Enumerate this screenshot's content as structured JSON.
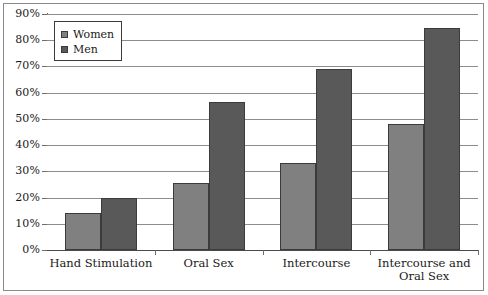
{
  "chart_data": {
    "type": "bar",
    "title": "",
    "subtitle": "",
    "xlabel": "",
    "ylabel": "",
    "categories": [
      "Hand Stimulation",
      "Oral Sex",
      "Intercourse",
      "Intercourse and\nOral Sex"
    ],
    "series": [
      {
        "name": "Women",
        "color": "#808080",
        "values": [
          14,
          25.5,
          33,
          48
        ]
      },
      {
        "name": "Men",
        "color": "#595959",
        "values": [
          20,
          56.5,
          69,
          84.5
        ]
      }
    ],
    "ylim": [
      0,
      90
    ],
    "ytick_values": [
      0,
      10,
      20,
      30,
      40,
      50,
      60,
      70,
      80,
      90
    ],
    "ytick_labels": [
      "0%",
      "10%",
      "20%",
      "30%",
      "40%",
      "50%",
      "60%",
      "70%",
      "80%",
      "90%"
    ],
    "grid": "horizontal",
    "legend_position": "top-left",
    "legend_entries": [
      "Women",
      "Men"
    ],
    "annotations": [],
    "bar_border_color": "#3b3b3b",
    "gridline_color": "#8d8d8d",
    "axis_color": "#6e6e6e",
    "background_color": "#ffffff",
    "frame_color": "#8a8a8a"
  }
}
